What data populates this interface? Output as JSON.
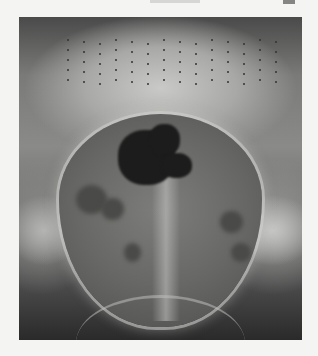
{
  "page": {
    "header_text_visible": false,
    "figure": {
      "type": "radiograph",
      "description": "Grayscale X-ray of pelvis/abdomen with dotted grid markers at top",
      "colors": {
        "page_background": "#f4f4f2",
        "dark": "#1c1c1c",
        "mid": "#7a7a78",
        "light": "#c9c9c7"
      }
    }
  }
}
